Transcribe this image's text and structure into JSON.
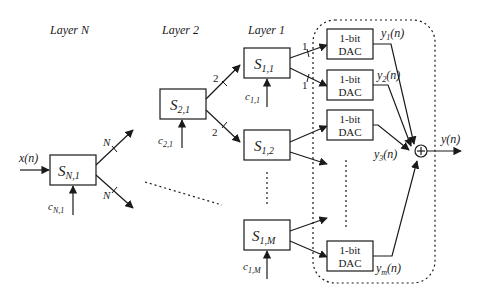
{
  "layers": {
    "layer_n": "Layer N",
    "layer_2": "Layer 2",
    "layer_1": "Layer 1"
  },
  "input": {
    "label_main": "x",
    "label_arg": "(n)"
  },
  "output": {
    "label_main": "y",
    "label_arg": "(n)"
  },
  "blocks": {
    "s_n1": {
      "main": "S",
      "sub": "N,1",
      "control_main": "c",
      "control_sub": "N,1",
      "branch_top": "N",
      "branch_bottom": "N"
    },
    "s_21": {
      "main": "S",
      "sub": "2,1",
      "control_main": "c",
      "control_sub": "2,1",
      "branch_top": "2",
      "branch_bottom": "2"
    },
    "s_11": {
      "main": "S",
      "sub": "1,1",
      "control_main": "c",
      "control_sub": "1,1",
      "branch_top": "1",
      "branch_bottom": "1"
    },
    "s_12": {
      "main": "S",
      "sub": "1,2"
    },
    "s_1m": {
      "main": "S",
      "sub": "1,M",
      "control_main": "c",
      "control_sub": "1,M"
    }
  },
  "dacs": [
    {
      "line1": "1-bit",
      "line2": "DAC",
      "out_main": "y",
      "out_sub": "1",
      "out_arg": "(n)"
    },
    {
      "line1": "1-bit",
      "line2": "DAC",
      "out_main": "y",
      "out_sub": "2",
      "out_arg": "(n)"
    },
    {
      "line1": "1-bit",
      "line2": "DAC",
      "out_main": "y",
      "out_sub": "3",
      "out_arg": "(n)"
    },
    {
      "line1": "1-bit",
      "line2": "DAC",
      "out_main": "y",
      "out_sub": "m",
      "out_arg": "(n)"
    }
  ],
  "summer": {
    "symbol": "+"
  },
  "colors": {
    "stroke": "#1a1a1a",
    "background": "#ffffff"
  }
}
